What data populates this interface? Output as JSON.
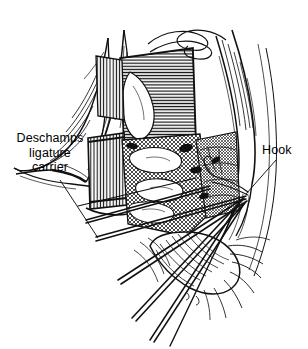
{
  "figure": {
    "name": "surgical-dissection-illustration",
    "style": "pen-and-ink line drawing",
    "ink_color": "#111111",
    "background_color": "#ffffff",
    "width": 308,
    "height": 349
  },
  "labels": [
    {
      "id": "deschamps",
      "text": "Deschamps\nligature\ncarrier",
      "lines": [
        "Deschamps",
        "ligature",
        "carrier"
      ],
      "position": "upper-left",
      "leader": "diagonal line down-right to instrument shafts"
    },
    {
      "id": "hook",
      "text": "Hook",
      "lines": [
        "Hook"
      ],
      "position": "upper-right",
      "leader": "diagonal line down-left to hook tip"
    }
  ],
  "structures": [
    {
      "name": "retracted-tissue-flap-left",
      "description": "pointed skin and fascia flap, contour hatched"
    },
    {
      "name": "retracted-tissue-flap-right",
      "description": "elongated muscle fibers along right margin"
    },
    {
      "name": "muscle-block-center",
      "description": "horizontally line-hatched rectangular muscle belly"
    },
    {
      "name": "retractor-blade-left",
      "description": "vertically striped retractor blade"
    },
    {
      "name": "retractor-blade-center",
      "description": "vertically striped retractor blade at midline"
    },
    {
      "name": "vessel-suture-loop",
      "description": "wavy sinuous strand across upper field"
    },
    {
      "name": "deep-tissue-stipple",
      "description": "dense cross-hatched deep tissue in wound bed"
    },
    {
      "name": "lobed-organ-inferior",
      "description": "rounded lobed structure with radiating fibers at base"
    },
    {
      "name": "instrument-shafts",
      "description": "five slender instrument shafts fanning to lower left"
    },
    {
      "name": "hook-instrument",
      "description": "fine hook converging at right of wound"
    }
  ]
}
